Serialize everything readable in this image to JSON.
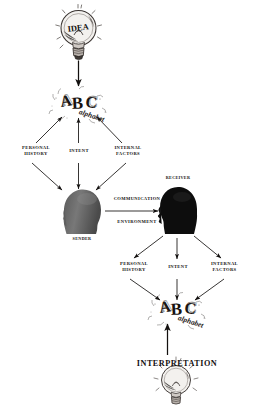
{
  "diagram": {
    "background_color": "#ffffff",
    "ink_color": "#13100f",
    "sender_head_color": "#6f6f6f",
    "receiver_head_color": "#0d0d0d"
  },
  "nodes": {
    "idea_bulb": {
      "label": "IDEA",
      "icon": "lightbulb-icon"
    },
    "encode_alphabet": {
      "label": "ABC",
      "sublabel": "alphabet",
      "icon": "abc-letters-icon"
    },
    "sender_head": {
      "label": "SENDER",
      "icon": "sender-head-silhouette-icon"
    },
    "receiver_head": {
      "label": "RECEIVER",
      "icon": "receiver-head-silhouette-icon"
    },
    "decode_alphabet": {
      "label": "ABC",
      "sublabel": "alphabet",
      "icon": "abc-letters-icon"
    },
    "interpretation_bulb": {
      "label": "INTERPRETATION",
      "icon": "lightbulb-icon"
    }
  },
  "labels": {
    "sender_personal_history": "PERSONAL\nHISTORY",
    "sender_intent": "INTENT",
    "sender_internal_factors": "INTERNAL\nFACTORS",
    "communication": "COMMUNICATION",
    "environment": "ENVIRONMENT",
    "sender_caption": "SENDER",
    "receiver_caption": "RECEIVER",
    "receiver_personal_history": "PERSONAL\nHISTORY",
    "receiver_intent": "INTENT",
    "receiver_internal_factors": "INTERNAL\nFACTORS",
    "interpretation": "INTERPRETATION"
  }
}
